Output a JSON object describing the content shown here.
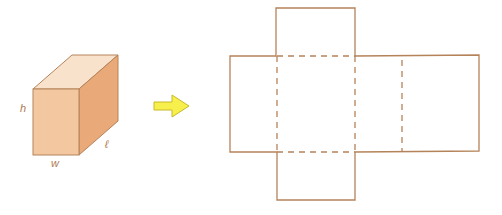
{
  "diagram": {
    "colors": {
      "stroke": "#b5835a",
      "front_face": "#f3c8a0",
      "top_face": "#f8e2cc",
      "side_face": "#e9a978",
      "arrow_fill": "#f6ef4c",
      "arrow_stroke": "#c9b92a"
    },
    "prism": {
      "labels": {
        "height": "h",
        "width": "w",
        "length": "ℓ"
      }
    },
    "arrow": {
      "direction": "right"
    },
    "net": {
      "faces": 6,
      "fold_lines": "dashed"
    }
  }
}
